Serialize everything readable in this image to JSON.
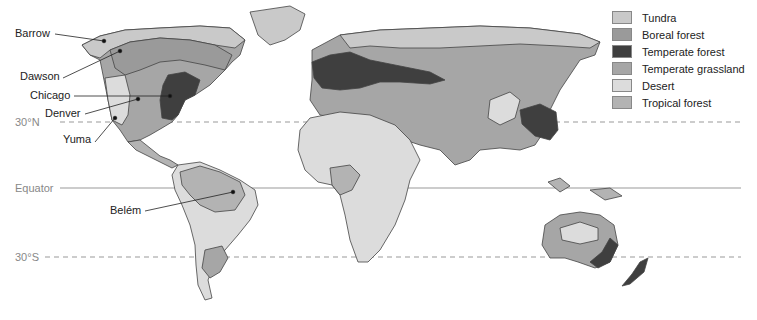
{
  "legend": {
    "items": [
      {
        "label": "Tundra",
        "color": "#c9c9c9"
      },
      {
        "label": "Boreal forest",
        "color": "#9a9a9a"
      },
      {
        "label": "Temperate forest",
        "color": "#3f3f3f"
      },
      {
        "label": "Temperate grassland",
        "color": "#a6a6a6"
      },
      {
        "label": "Desert",
        "color": "#dcdcdc"
      },
      {
        "label": "Tropical forest",
        "color": "#b3b3b3"
      }
    ]
  },
  "latitudes": {
    "north30": "30°N",
    "equator": "Equator",
    "south30": "30°S"
  },
  "cities": {
    "barrow": "Barrow",
    "dawson": "Dawson",
    "chicago": "Chicago",
    "denver": "Denver",
    "yuma": "Yuma",
    "belem": "Belém"
  }
}
